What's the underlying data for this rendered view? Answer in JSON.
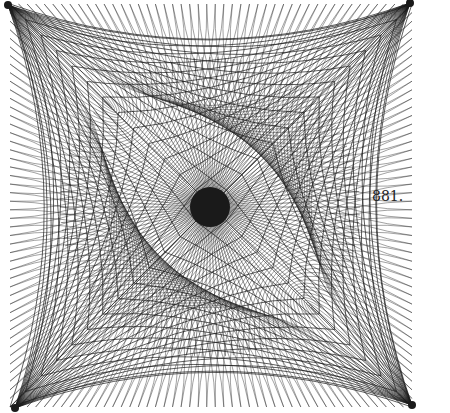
{
  "figure": {
    "caption": "881.",
    "ink_color": "#1a1a1a",
    "paper_color": "#ffffff",
    "center": [
      210,
      207
    ],
    "center_blob_radius": 20,
    "corners": [
      [
        8,
        5
      ],
      [
        410,
        3
      ],
      [
        15,
        408
      ],
      [
        412,
        405
      ]
    ],
    "ray_count": 120,
    "corner_fan_count": 26,
    "lattice_arcs": 48
  }
}
